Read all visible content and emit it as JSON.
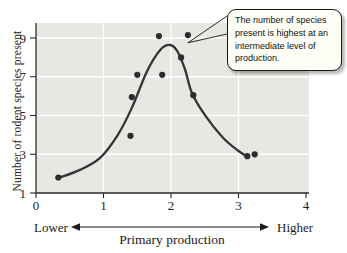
{
  "colors": {
    "plot_bg": "#e7e7e3",
    "grid": "#ffffff",
    "axis": "#2a2a2a",
    "curve": "#363436",
    "point": "#2e2c2e",
    "callout_bg": "#fffef6",
    "text": "#1c1c1c"
  },
  "labels": {
    "y_axis": "Number of rodent species present",
    "x_axis": "Primary production",
    "lower": "Lower",
    "higher": "Higher"
  },
  "annotation": {
    "text": "The number of species present is highest at an intermediate level of production.",
    "lines": [
      "The number of species",
      "present is highest at an",
      "intermediate level of",
      "production."
    ],
    "target": [
      2.25,
      8.75
    ]
  },
  "chart_data": {
    "type": "scatter",
    "title": "",
    "xlabel": "Primary production",
    "ylabel": "Number of rodent species present",
    "xlim": [
      0,
      4.05
    ],
    "ylim": [
      1,
      9.8
    ],
    "x_ticks": [
      0,
      1,
      2,
      3,
      4
    ],
    "y_ticks": [
      1,
      3,
      5,
      7,
      9
    ],
    "grid_x": [
      1,
      2,
      3
    ],
    "grid_y": [
      3,
      5,
      7,
      9
    ],
    "grid_color": "#ffffff",
    "x_gradient_labels": [
      "Lower",
      "Higher"
    ],
    "points": [
      [
        0.33,
        1.8
      ],
      [
        1.4,
        3.95
      ],
      [
        1.42,
        5.95
      ],
      [
        1.5,
        7.1
      ],
      [
        1.82,
        9.1
      ],
      [
        1.87,
        7.1
      ],
      [
        2.15,
        8.0
      ],
      [
        2.25,
        9.15
      ],
      [
        2.33,
        6.05
      ],
      [
        3.13,
        2.9
      ],
      [
        3.24,
        3.0
      ]
    ],
    "fitted_curve": [
      [
        0.33,
        1.77
      ],
      [
        0.65,
        2.19
      ],
      [
        0.95,
        2.81
      ],
      [
        1.21,
        3.99
      ],
      [
        1.42,
        5.39
      ],
      [
        1.64,
        7.25
      ],
      [
        1.84,
        8.38
      ],
      [
        1.99,
        8.64
      ],
      [
        2.1,
        8.28
      ],
      [
        2.21,
        7.35
      ],
      [
        2.31,
        6.16
      ],
      [
        2.5,
        5.03
      ],
      [
        2.76,
        3.89
      ],
      [
        2.98,
        3.22
      ],
      [
        3.14,
        2.86
      ]
    ],
    "annotation": "The number of species present is highest at an intermediate level of production."
  }
}
